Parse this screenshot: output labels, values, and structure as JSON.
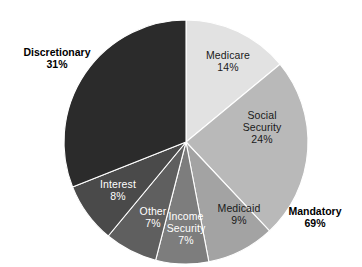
{
  "chart_data": {
    "type": "pie",
    "title": "",
    "subtitle": "",
    "xlabel": "",
    "ylabel": "",
    "legend_position": "none",
    "grid": false,
    "units": "percent",
    "start_angle_deg": 0,
    "direction": "clockwise",
    "categories": [
      "Medicare",
      "Social Security",
      "Medicaid",
      "Income Security",
      "Other",
      "Interest",
      "Discretionary"
    ],
    "values": [
      14,
      24,
      9,
      7,
      7,
      8,
      31
    ],
    "colors": [
      "#e2e2e2",
      "#b9b9b9",
      "#a3a3a3",
      "#7d7d7d",
      "#5f5f5f",
      "#4a4a4a",
      "#2b2b2b"
    ],
    "slices": [
      {
        "label": "Medicare",
        "value": 14,
        "value_text": "14%",
        "color": "#e2e2e2",
        "text_color": "#1a1a1a",
        "group": "Mandatory"
      },
      {
        "label": "Social Security",
        "value": 24,
        "value_text": "24%",
        "color": "#b9b9b9",
        "text_color": "#1a1a1a",
        "group": "Mandatory"
      },
      {
        "label": "Medicaid",
        "value": 9,
        "value_text": "9%",
        "color": "#a3a3a3",
        "text_color": "#1a1a1a",
        "group": "Mandatory"
      },
      {
        "label": "Income Security",
        "value": 7,
        "value_text": "7%",
        "color": "#7d7d7d",
        "text_color": "#ffffff",
        "group": "Mandatory"
      },
      {
        "label": "Other",
        "value": 7,
        "value_text": "7%",
        "color": "#5f5f5f",
        "text_color": "#ffffff",
        "group": "Mandatory"
      },
      {
        "label": "Interest",
        "value": 8,
        "value_text": "8%",
        "color": "#4a4a4a",
        "text_color": "#ffffff",
        "group": "Mandatory"
      },
      {
        "label": "Discretionary",
        "value": 31,
        "value_text": "31%",
        "color": "#2b2b2b",
        "text_color": "#ffffff",
        "group": "Discretionary"
      }
    ],
    "annotations": [
      {
        "label": "Discretionary",
        "value": 31,
        "value_text": "31%",
        "position": "outside-upper-left"
      },
      {
        "label": "Mandatory",
        "value": 69,
        "value_text": "69%",
        "position": "outside-lower-right"
      }
    ]
  },
  "labels": {
    "medicare": {
      "name": "Medicare",
      "pct": "14%"
    },
    "social_security": {
      "name": "Social",
      "name2": "Security",
      "pct": "24%"
    },
    "medicaid": {
      "name": "Medicaid",
      "pct": "9%"
    },
    "income_security": {
      "name": "Income",
      "name2": "Security",
      "pct": "7%"
    },
    "other": {
      "name": "Other",
      "pct": "7%"
    },
    "interest": {
      "name": "Interest",
      "pct": "8%"
    },
    "discretionary": {
      "name": "Discretionary",
      "pct": "31%"
    },
    "mandatory": {
      "name": "Mandatory",
      "pct": "69%"
    }
  }
}
